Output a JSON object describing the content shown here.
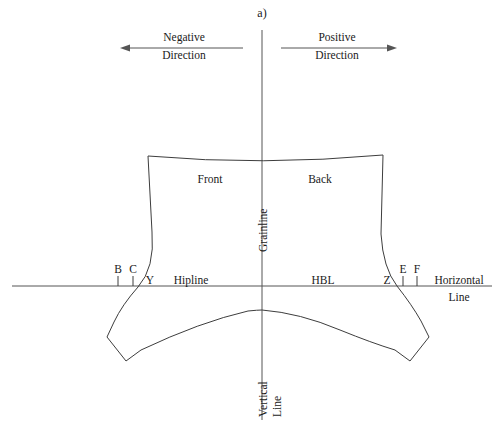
{
  "figure": {
    "title": "a)",
    "type": "garment pattern draft diagram"
  },
  "direction_indicators": {
    "negative": {
      "line1": "Negative",
      "line2": "Direction"
    },
    "positive": {
      "line1": "Positive",
      "line2": "Direction"
    }
  },
  "axes": {
    "grainline": "Grainline",
    "vertical_line": {
      "line1": "Vertical",
      "line2": "Line"
    },
    "horizontal_line": {
      "line1": "Horizontal",
      "line2": "Line"
    }
  },
  "pattern_labels": {
    "front": "Front",
    "back": "Back",
    "hipline": "Hipline",
    "hbl": "HBL"
  },
  "points": {
    "b": "B",
    "c": "C",
    "y": "Y",
    "z": "Z",
    "e": "E",
    "f": "F"
  },
  "colors": {
    "background": "#ffffff",
    "stroke": "#3d3d3d",
    "text": "#1a1a1a"
  }
}
